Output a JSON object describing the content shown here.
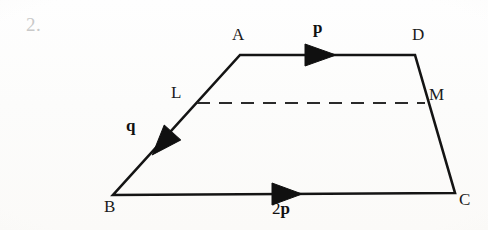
{
  "figure": {
    "question_number": "2.",
    "shape": "trapezoid",
    "stroke_color": "#141414",
    "dash_color": "#2a2a2a",
    "question_number_color": "#c9c9c9",
    "vertices": [
      {
        "name": "A",
        "label": "A",
        "x": 240,
        "y": 55
      },
      {
        "name": "D",
        "label": "D",
        "x": 415,
        "y": 55
      },
      {
        "name": "C",
        "label": "C",
        "x": 455,
        "y": 193
      },
      {
        "name": "B",
        "label": "B",
        "x": 113,
        "y": 195
      }
    ],
    "midpoints": [
      {
        "name": "L",
        "label": "L",
        "x": 197,
        "y": 103,
        "on_edge": "AB"
      },
      {
        "name": "M",
        "label": "M",
        "x": 425,
        "y": 103,
        "on_edge": "DC"
      }
    ],
    "dashed_segment": {
      "label": "LM",
      "from": "L",
      "to": "M"
    },
    "vectors": [
      {
        "name": "p",
        "label": "p",
        "coefficient": "",
        "edge": "AD",
        "direction": "right",
        "arrow_x": 320,
        "arrow_y": 55
      },
      {
        "name": "2p",
        "label": "p",
        "coefficient": "2",
        "edge": "BC",
        "direction": "right",
        "arrow_x": 285,
        "arrow_y": 194
      },
      {
        "name": "q",
        "label": "q",
        "coefficient": "",
        "edge": "AB",
        "direction": "down-left",
        "arrow_x": 163,
        "arrow_y": 143
      }
    ]
  }
}
